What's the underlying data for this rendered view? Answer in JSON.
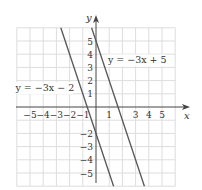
{
  "chart_data": {
    "type": "line",
    "title": "",
    "xlabel": "x",
    "ylabel": "y",
    "xlim": [
      -6,
      6
    ],
    "ylim": [
      -6,
      6
    ],
    "grid": true,
    "x_tick_labels": [
      "−5",
      "−4",
      "−3",
      "−2",
      "−1",
      "1",
      "3",
      "4",
      "5"
    ],
    "x_tick_values": [
      -5,
      -4,
      -3,
      -2,
      -1,
      1,
      3,
      4,
      5
    ],
    "y_tick_labels": [
      "5",
      "4",
      "3",
      "2",
      "1",
      "−2",
      "−3",
      "−4",
      "−5"
    ],
    "y_tick_values": [
      5,
      4,
      3,
      2,
      1,
      -2,
      -3,
      -4,
      -5
    ],
    "series": [
      {
        "name": "y = −3x + 5",
        "slope": -3,
        "intercept": 5,
        "x": [
          -0.333,
          3.667
        ],
        "y": [
          6,
          -6
        ]
      },
      {
        "name": "y = −3x − 2",
        "slope": -3,
        "intercept": -2,
        "x": [
          -2.667,
          1.333
        ],
        "y": [
          6,
          -6
        ]
      }
    ],
    "annotations": [
      {
        "text": "y = −3x + 5",
        "x": 0.9,
        "y": 3.3
      },
      {
        "text": "y = −3x − 2",
        "x": -6.1,
        "y": 1.2
      }
    ],
    "colors": {
      "line": "#555555",
      "grid": "#dddddd",
      "axis": "#444444"
    }
  }
}
